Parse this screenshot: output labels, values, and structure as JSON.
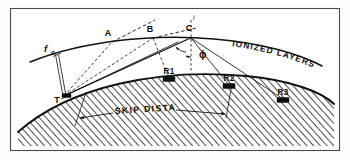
{
  "figure": {
    "background_color": "#fdfdfc",
    "ink_color": "#0d0d0d",
    "frame_color": "#4a4a4a"
  },
  "labels": {
    "ionized_layers": "IONIZED LAYERS",
    "skip_distance": "SKIP DISTANCE",
    "critical_freq": "f",
    "critical_freq_sub": "o",
    "angle_phi": "ϕ",
    "normal_mark": "i",
    "transmitter": "T",
    "reflection_a": "A",
    "reflection_b": "B",
    "reflection_c": "C",
    "receiver_1": "R1",
    "receiver_2": "R2",
    "receiver_3": "R3"
  },
  "diagram_data": {
    "type": "schematic",
    "subject": "radio wave ionospheric propagation and skip distance",
    "transmitter": {
      "id": "T",
      "x": 64,
      "y": 96
    },
    "ionosphere_points": [
      {
        "id": "A",
        "x": 112,
        "y": 42
      },
      {
        "id": "B",
        "x": 153,
        "y": 38
      },
      {
        "id": "C",
        "x": 191,
        "y": 38
      }
    ],
    "receivers": [
      {
        "id": "R1",
        "x": 169,
        "y": 80
      },
      {
        "id": "R2",
        "x": 229,
        "y": 87
      },
      {
        "id": "R3",
        "x": 283,
        "y": 101
      }
    ],
    "rays": [
      {
        "from": "T",
        "via": "A",
        "to": "escape",
        "style": "dashed",
        "note": "penetrates layer"
      },
      {
        "from": "T",
        "via": "B",
        "to": "R1",
        "style": "dashed"
      },
      {
        "from": "T",
        "via": "C",
        "to": "R2",
        "style": "solid"
      },
      {
        "from": "T",
        "via": "C",
        "to": "R3",
        "style": "solid"
      },
      {
        "from": "T",
        "to": "fo",
        "style": "vertical",
        "note": "critical frequency vertical incidence"
      }
    ],
    "angle": {
      "symbol": "ϕ",
      "at": "C",
      "between": [
        "normal",
        "incident ray"
      ]
    },
    "skip_distance": {
      "from_x": 88,
      "to_x": 229,
      "label": "SKIP DISTANCE"
    }
  }
}
